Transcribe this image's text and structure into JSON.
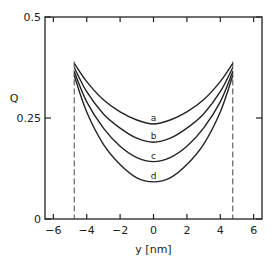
{
  "chart_data": {
    "type": "line",
    "title": "",
    "xlabel": "y [nm]",
    "ylabel": "Q",
    "xlim": [
      -6.5,
      6.5
    ],
    "ylim": [
      0,
      0.5
    ],
    "x_ticks": [
      -6,
      -4,
      -2,
      0,
      2,
      4,
      6
    ],
    "x_tick_labels": [
      "-6",
      "-4",
      "-2",
      "0",
      "2",
      "4",
      "6"
    ],
    "y_ticks": [
      0,
      0.25,
      0.5
    ],
    "y_tick_labels": [
      "0",
      "0.25",
      "0.5"
    ],
    "grid": false,
    "legend": "inline curve labels",
    "boundaries": [
      {
        "x": -4.75,
        "style": "dashed"
      },
      {
        "x": 4.75,
        "style": "dashed"
      }
    ],
    "series": [
      {
        "name": "a",
        "x": [
          -4.75,
          -4,
          -3,
          -2,
          -1,
          0,
          1,
          2,
          3,
          4,
          4.75
        ],
        "values": [
          0.385,
          0.34,
          0.295,
          0.265,
          0.245,
          0.235,
          0.245,
          0.265,
          0.295,
          0.34,
          0.385
        ]
      },
      {
        "name": "b",
        "x": [
          -4.75,
          -4,
          -3,
          -2,
          -1,
          0,
          1,
          2,
          3,
          4,
          4.75
        ],
        "values": [
          0.375,
          0.315,
          0.26,
          0.225,
          0.2,
          0.19,
          0.2,
          0.225,
          0.26,
          0.315,
          0.375
        ]
      },
      {
        "name": "c",
        "x": [
          -4.75,
          -4,
          -3,
          -2,
          -1,
          0,
          1,
          2,
          3,
          4,
          4.75
        ],
        "values": [
          0.365,
          0.29,
          0.225,
          0.18,
          0.152,
          0.142,
          0.152,
          0.18,
          0.225,
          0.29,
          0.365
        ]
      },
      {
        "name": "d",
        "x": [
          -4.75,
          -4,
          -3,
          -2,
          -1,
          0,
          1,
          2,
          3,
          4,
          4.75
        ],
        "values": [
          0.355,
          0.265,
          0.185,
          0.135,
          0.102,
          0.092,
          0.102,
          0.135,
          0.185,
          0.265,
          0.355
        ]
      }
    ]
  }
}
